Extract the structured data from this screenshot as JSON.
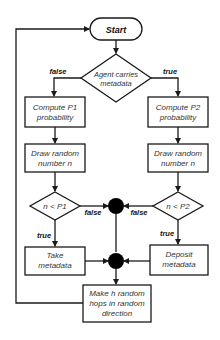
{
  "diagram": {
    "nodes": {
      "start": {
        "label": "Start"
      },
      "agent_decision": {
        "line1": "Agent carries",
        "line2": "metadata"
      },
      "compute_p1": {
        "line1": "Compute P1",
        "line2": "probability"
      },
      "compute_p2": {
        "line1": "Compute P2",
        "line2": "probability"
      },
      "draw_left": {
        "line1": "Draw random",
        "line2": "number n"
      },
      "draw_right": {
        "line1": "Draw random",
        "line2": "number n"
      },
      "cond_p1": {
        "label": "n < P1"
      },
      "cond_p2": {
        "label": "n < P2"
      },
      "take": {
        "line1": "Take",
        "line2": "metadata"
      },
      "deposit": {
        "line1": "Deposit",
        "line2": "metadata"
      },
      "hops": {
        "line1": "Make h random",
        "line2": "hops in random",
        "line3": "direction"
      }
    },
    "edge_labels": {
      "agent_false": "false",
      "agent_true": "true",
      "p1_false": "false",
      "p2_false": "false",
      "p1_true": "true",
      "p2_true": "true"
    },
    "colors": {
      "stroke": "#1a1a1a",
      "text": "#333333",
      "background": "#ffffff"
    }
  }
}
